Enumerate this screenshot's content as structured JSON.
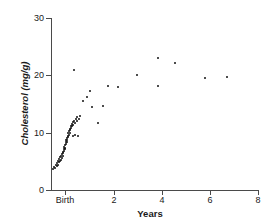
{
  "chart_data": {
    "type": "scatter",
    "title": "",
    "xlabel": "Years",
    "ylabel": "Cholesterol (mg/g)",
    "xlim": [
      -0.6,
      8
    ],
    "ylim": [
      0,
      30
    ],
    "grid": false,
    "legend": null,
    "x_ticks": [
      {
        "value": 0,
        "label": "Birth"
      },
      {
        "value": 2,
        "label": "2"
      },
      {
        "value": 4,
        "label": "4"
      },
      {
        "value": 6,
        "label": "6"
      },
      {
        "value": 8,
        "label": "8"
      }
    ],
    "y_ticks": [
      {
        "value": 0,
        "label": "0"
      },
      {
        "value": 10,
        "label": "10"
      },
      {
        "value": 20,
        "label": "20"
      },
      {
        "value": 30,
        "label": "30"
      }
    ],
    "series_name": "Cholesterol vs age",
    "points": [
      [
        -0.52,
        3.6
      ],
      [
        -0.47,
        4.0
      ],
      [
        -0.44,
        3.8
      ],
      [
        -0.4,
        4.3
      ],
      [
        -0.37,
        4.1
      ],
      [
        -0.34,
        4.7
      ],
      [
        -0.32,
        4.4
      ],
      [
        -0.29,
        5.0
      ],
      [
        -0.27,
        4.8
      ],
      [
        -0.25,
        5.4
      ],
      [
        -0.23,
        5.1
      ],
      [
        -0.21,
        5.7
      ],
      [
        -0.19,
        5.3
      ],
      [
        -0.17,
        6.0
      ],
      [
        -0.15,
        5.6
      ],
      [
        -0.13,
        6.3
      ],
      [
        -0.12,
        6.0
      ],
      [
        -0.1,
        6.7
      ],
      [
        -0.09,
        6.4
      ],
      [
        -0.07,
        7.1
      ],
      [
        -0.06,
        6.8
      ],
      [
        -0.04,
        7.5
      ],
      [
        -0.03,
        7.2
      ],
      [
        -0.01,
        7.9
      ],
      [
        0.0,
        7.4
      ],
      [
        0.01,
        8.3
      ],
      [
        0.03,
        8.0
      ],
      [
        0.04,
        8.7
      ],
      [
        0.05,
        8.4
      ],
      [
        0.07,
        9.1
      ],
      [
        0.08,
        8.8
      ],
      [
        0.09,
        9.5
      ],
      [
        0.11,
        9.2
      ],
      [
        0.12,
        9.9
      ],
      [
        0.14,
        9.6
      ],
      [
        0.15,
        10.3
      ],
      [
        0.17,
        10.0
      ],
      [
        0.18,
        10.7
      ],
      [
        0.2,
        10.4
      ],
      [
        0.22,
        11.1
      ],
      [
        0.24,
        10.8
      ],
      [
        0.26,
        11.5
      ],
      [
        0.28,
        11.2
      ],
      [
        0.31,
        11.8
      ],
      [
        0.33,
        11.4
      ],
      [
        0.36,
        12.1
      ],
      [
        0.39,
        11.7
      ],
      [
        0.42,
        12.4
      ],
      [
        0.46,
        12.0
      ],
      [
        0.5,
        12.7
      ],
      [
        0.55,
        12.3
      ],
      [
        0.6,
        12.9
      ],
      [
        0.3,
        9.4
      ],
      [
        0.4,
        9.6
      ],
      [
        0.52,
        9.4
      ],
      [
        0.36,
        21.0
      ],
      [
        0.72,
        15.5
      ],
      [
        0.88,
        16.2
      ],
      [
        1.0,
        17.2
      ],
      [
        1.1,
        14.5
      ],
      [
        1.36,
        11.6
      ],
      [
        1.58,
        14.6
      ],
      [
        1.78,
        18.2
      ],
      [
        2.18,
        18.0
      ],
      [
        2.96,
        20.0
      ],
      [
        3.84,
        23.1
      ],
      [
        3.86,
        18.1
      ],
      [
        4.56,
        22.1
      ],
      [
        5.78,
        19.6
      ],
      [
        6.72,
        19.7
      ]
    ]
  }
}
